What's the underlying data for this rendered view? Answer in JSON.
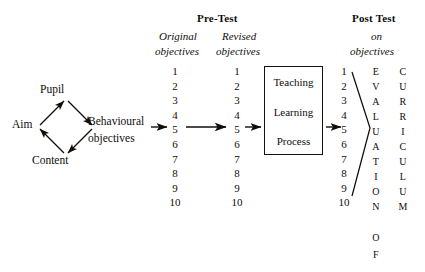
{
  "diagram": {
    "ink_color": "#100d0b",
    "background": "#ffffff",
    "input_cluster": {
      "name": "aim-pupil-content-diamond",
      "nodes": {
        "left": "Aim",
        "top": "Pupil",
        "bottom": "Content"
      }
    },
    "behavioural": {
      "line1": "Behavioural",
      "line2": "objectives"
    },
    "pretest": {
      "heading": "Pre-Test",
      "col1": {
        "line1": "Original",
        "line2": "objectives"
      },
      "col2": {
        "line1": "Revised",
        "line2": "objectives"
      },
      "numbers": [
        "1",
        "2",
        "3",
        "4",
        "5",
        "6",
        "7",
        "8",
        "9",
        "10"
      ],
      "linked_number": "4"
    },
    "process_box": {
      "lines": [
        "Teaching",
        "Learning",
        "Process"
      ]
    },
    "posttest": {
      "heading": "Post Test",
      "sub1": "on",
      "sub2": "objectives",
      "numbers": [
        "1",
        "2",
        "3",
        "4",
        "5",
        "6",
        "7",
        "8",
        "9",
        "10"
      ],
      "linked_number": "4"
    },
    "acrostic_left": {
      "word": "EVALUATION",
      "letters": [
        "E",
        "V",
        "A",
        "L",
        "U",
        "A",
        "T",
        "I",
        "O",
        "N"
      ],
      "tail_word": "OF",
      "tail_letters": [
        "O",
        "F"
      ]
    },
    "acrostic_right": {
      "word": "CURRICULUM",
      "letters": [
        "C",
        "U",
        "R",
        "R",
        "I",
        "C",
        "U",
        "L",
        "U",
        "M"
      ]
    }
  }
}
